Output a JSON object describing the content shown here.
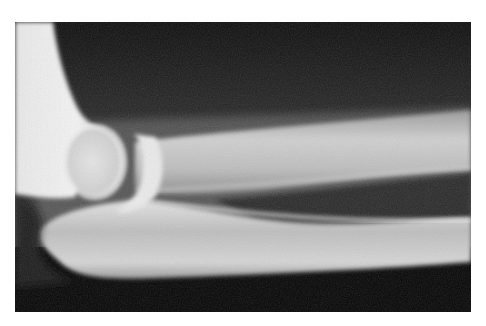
{
  "image": {
    "subject": "Lateral radiograph of elbow joint",
    "alt": "X-ray of an elbow showing the distal humerus, radial head, ulna and forearm bones",
    "colors": {
      "background": "#ffffff",
      "film_dark": "#0a0a0a",
      "soft_tissue": "#4a4a4a",
      "bone": "#d8d8d8",
      "bone_bright": "#f2f2f2"
    }
  }
}
